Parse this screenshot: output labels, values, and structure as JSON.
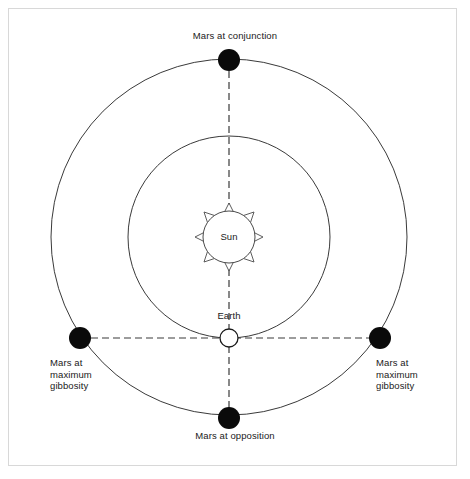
{
  "diagram": {
    "frame": {
      "border_color": "#d8d8d8",
      "background_color": "#ffffff"
    },
    "center": {
      "x": 229,
      "y": 338
    },
    "colors": {
      "orbit_line": "#3a3a3a",
      "sight_line": "#3a3a3a",
      "mars_fill": "#000000",
      "earth_fill": "#ffffff",
      "earth_stroke": "#1a1a1a",
      "sun_fill": "#ffffff",
      "sun_stroke": "#4a4a4a",
      "text": "#1a1a1a"
    },
    "bodies": {
      "sun": {
        "name": "Sun",
        "label": "Sun",
        "cx": 229,
        "cy": 237,
        "r": 26,
        "ray_count": 8
      },
      "earth": {
        "name": "Earth",
        "label": "Earth",
        "cx": 229,
        "cy": 338,
        "r": 9
      },
      "mars_positions": [
        {
          "id": "mars-conjunction",
          "label": "Mars at conjunction",
          "cx": 229,
          "cy": 60,
          "r": 11,
          "angle_deg": 90
        },
        {
          "id": "mars-gibbosity-right",
          "label": "Mars at\nmaximum\ngibbosity",
          "cx": 380,
          "cy": 338,
          "r": 11,
          "angle_deg": 0
        },
        {
          "id": "mars-opposition",
          "label": "Mars at opposition",
          "cx": 229,
          "cy": 418,
          "r": 11,
          "angle_deg": 270
        },
        {
          "id": "mars-gibbosity-left",
          "label": "Mars at\nmaximum\ngibbosity",
          "cx": 80,
          "cy": 338,
          "r": 11,
          "angle_deg": 180
        }
      ]
    },
    "orbits": [
      {
        "id": "earth-orbit",
        "name": "Earth orbit",
        "cx": 229,
        "cy": 237,
        "r": 101,
        "style": "solid"
      },
      {
        "id": "mars-orbit",
        "name": "Mars orbit",
        "cx": 229,
        "cy": 237,
        "r": 178,
        "style": "solid"
      }
    ],
    "sight_lines": [
      {
        "id": "line-vertical",
        "name": "Earth to conjunction and opposition sight line",
        "x1": 229,
        "y1": 60,
        "x2": 229,
        "y2": 418,
        "style": "dashed"
      },
      {
        "id": "line-horizontal",
        "name": "Earth to maximum gibbosity sight line",
        "x1": 80,
        "y1": 338,
        "x2": 380,
        "y2": 338,
        "style": "dashed"
      }
    ],
    "labels": {
      "conjunction": "Mars at conjunction",
      "opposition": "Mars at opposition",
      "gibbosity_left": "Mars at\nmaximum\ngibbosity",
      "gibbosity_right": "Mars at\nmaximum\ngibbosity",
      "sun": "Sun",
      "earth": "Earth"
    }
  }
}
